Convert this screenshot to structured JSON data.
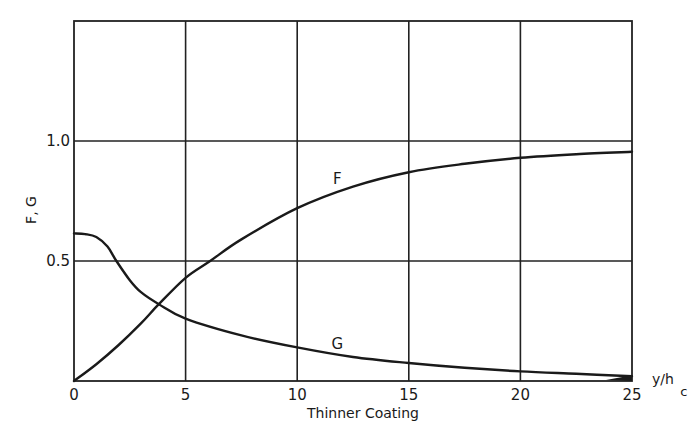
{
  "chart_data": {
    "type": "line",
    "title": "",
    "xlabel": "y/h_c",
    "xlabel_main": "y/h",
    "xlabel_sub": "c",
    "ylabel": "F, G",
    "caption": "Thinner Coating",
    "xlim": [
      0,
      25
    ],
    "ylim": [
      0,
      1.5
    ],
    "grid": true,
    "x_ticks": [
      "0",
      "5",
      "10",
      "15",
      "20",
      "25"
    ],
    "y_ticks": [
      "0.5",
      "1.0"
    ],
    "series": [
      {
        "name": "F",
        "x": [
          0,
          1,
          2,
          3,
          3.8,
          5,
          6.1,
          7.5,
          10,
          12.5,
          15,
          17.5,
          20,
          22.5,
          25
        ],
        "values": [
          0.0,
          0.07,
          0.15,
          0.24,
          0.32,
          0.43,
          0.5,
          0.59,
          0.72,
          0.81,
          0.87,
          0.905,
          0.93,
          0.945,
          0.955
        ]
      },
      {
        "name": "G",
        "x": [
          0,
          0.5,
          1,
          1.5,
          1.9,
          2.5,
          3,
          3.8,
          5,
          7.5,
          10,
          12.5,
          15,
          17.5,
          20,
          22.5,
          25
        ],
        "values": [
          0.615,
          0.612,
          0.6,
          0.56,
          0.5,
          0.42,
          0.37,
          0.32,
          0.26,
          0.19,
          0.14,
          0.1,
          0.075,
          0.055,
          0.04,
          0.03,
          0.02
        ]
      }
    ],
    "series_labels": [
      {
        "name": "F",
        "x": 11.8,
        "y": 0.82
      },
      {
        "name": "G",
        "x": 11.8,
        "y": 0.135
      }
    ]
  }
}
